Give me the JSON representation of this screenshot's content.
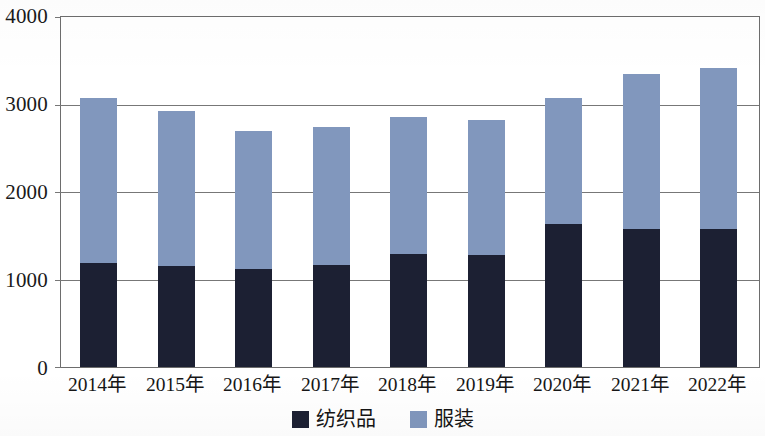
{
  "chart_data": {
    "type": "bar",
    "stacked": true,
    "title": "",
    "subtitle": "",
    "xlabel": "",
    "ylabel": "",
    "categories": [
      "2014年",
      "2015年",
      "2016年",
      "2017年",
      "2018年",
      "2019年",
      "2020年",
      "2021年",
      "2022年"
    ],
    "series": [
      {
        "name": "纺织品",
        "color": "#1c2033",
        "values": [
          1190,
          1160,
          1125,
          1165,
          1290,
          1285,
          1640,
          1580,
          1580
        ]
      },
      {
        "name": "服装",
        "color": "#8197bd",
        "values": [
          1880,
          1770,
          1570,
          1580,
          1570,
          1535,
          1430,
          1770,
          1840
        ]
      }
    ],
    "totals": [
      3070,
      2930,
      2695,
      2745,
      2860,
      2820,
      3070,
      3350,
      3385
    ],
    "ylim": [
      0,
      4000
    ],
    "yticks": [
      0,
      1000,
      2000,
      3000,
      4000
    ],
    "ytick_labels": [
      "0",
      "1000",
      "2000",
      "3000",
      "4000"
    ],
    "grid": true,
    "grid_axis": "y",
    "legend_position": "bottom"
  },
  "legend": {
    "items": [
      {
        "label": "纺织品",
        "color": "#1c2033"
      },
      {
        "label": "服装",
        "color": "#8197bd"
      }
    ]
  },
  "axes": {
    "y": {
      "labels": [
        "4000",
        "3000",
        "2000",
        "1000",
        "0"
      ],
      "values": [
        4000,
        3000,
        2000,
        1000,
        0
      ]
    },
    "x": {
      "labels": [
        "2014年",
        "2015年",
        "2016年",
        "2017年",
        "2018年",
        "2019年",
        "2020年",
        "2021年",
        "2022年"
      ]
    }
  }
}
